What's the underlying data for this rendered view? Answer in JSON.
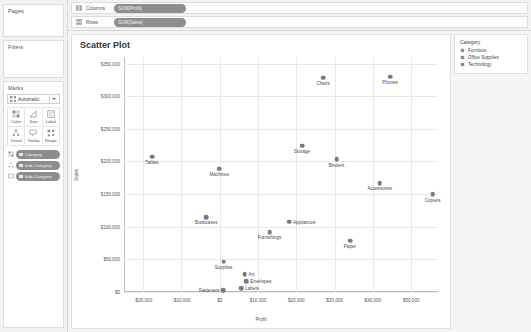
{
  "left_rail": {
    "pages": {
      "title": "Pages"
    },
    "filters": {
      "title": "Filters"
    },
    "marks": {
      "title": "Marks",
      "mark_type": "Automatic",
      "buttons": [
        {
          "label": "Color",
          "icon": "color-icon"
        },
        {
          "label": "Size",
          "icon": "size-icon"
        },
        {
          "label": "Label",
          "icon": "label-icon"
        },
        {
          "label": "Detail",
          "icon": "detail-icon"
        },
        {
          "label": "Tooltip",
          "icon": "tooltip-icon"
        },
        {
          "label": "Shape",
          "icon": "shape-icon"
        }
      ],
      "pills": [
        {
          "label": "Category",
          "lead": "color-icon"
        },
        {
          "label": "Sub-Category",
          "lead": "detail-icon"
        },
        {
          "label": "Sub-Category",
          "lead": "label-icon"
        }
      ]
    }
  },
  "shelves": {
    "columns": {
      "name": "Columns",
      "pill": "SUM(Profit)"
    },
    "rows": {
      "name": "Rows",
      "pill": "SUM(Sales)"
    }
  },
  "legend": {
    "title": "Category",
    "items": [
      "Furniture",
      "Office Supplies",
      "Technology"
    ],
    "swatch_color": "#8c8c8c"
  },
  "chart_data": {
    "type": "scatter",
    "title": "Scatter Plot",
    "xlabel": "Profit",
    "ylabel": "Sales",
    "xlim": [
      -25000,
      57000
    ],
    "ylim": [
      0,
      360000
    ],
    "grid": true,
    "legend_position": "right",
    "mark_color": "#7a7a7a",
    "xticks": [
      "-$20,000",
      "-$10,000",
      "$0",
      "$10,000",
      "$20,000",
      "$30,000",
      "$40,000",
      "$50,000"
    ],
    "xtick_values": [
      -20000,
      -10000,
      0,
      10000,
      20000,
      30000,
      40000,
      50000
    ],
    "yticks": [
      "$0",
      "$50,000",
      "$100,000",
      "$150,000",
      "$200,000",
      "$250,000",
      "$300,000",
      "$350,000"
    ],
    "ytick_values": [
      0,
      50000,
      100000,
      150000,
      200000,
      250000,
      300000,
      350000
    ],
    "points": [
      {
        "label": "Chairs",
        "x": 27000,
        "y": 328000,
        "label_pos": "below"
      },
      {
        "label": "Phones",
        "x": 44500,
        "y": 330000,
        "label_pos": "below"
      },
      {
        "label": "Storage",
        "x": 21500,
        "y": 224000,
        "label_pos": "below"
      },
      {
        "label": "Binders",
        "x": 30500,
        "y": 203000,
        "label_pos": "below"
      },
      {
        "label": "Tables",
        "x": -17700,
        "y": 207000,
        "label_pos": "below"
      },
      {
        "label": "Machines",
        "x": -100,
        "y": 189000,
        "label_pos": "below"
      },
      {
        "label": "Accessories",
        "x": 41800,
        "y": 167000,
        "label_pos": "below"
      },
      {
        "label": "Copiers",
        "x": 55600,
        "y": 150000,
        "label_pos": "below"
      },
      {
        "label": "Bookcases",
        "x": -3500,
        "y": 115000,
        "label_pos": "below"
      },
      {
        "label": "Appliances",
        "x": 18100,
        "y": 107500,
        "label_pos": "right"
      },
      {
        "label": "Furnishings",
        "x": 13000,
        "y": 92000,
        "label_pos": "below"
      },
      {
        "label": "Paper",
        "x": 34000,
        "y": 78500,
        "label_pos": "below"
      },
      {
        "label": "Supplies",
        "x": 1000,
        "y": 46500,
        "label_pos": "below"
      },
      {
        "label": "Art",
        "x": 6500,
        "y": 27500,
        "label_pos": "right"
      },
      {
        "label": "Envelopes",
        "x": 6900,
        "y": 16500,
        "label_pos": "right"
      },
      {
        "label": "Fasteners",
        "x": 950,
        "y": 3000,
        "label_pos": "left"
      },
      {
        "label": "Labels",
        "x": 5600,
        "y": 5500,
        "label_pos": "right"
      }
    ]
  }
}
